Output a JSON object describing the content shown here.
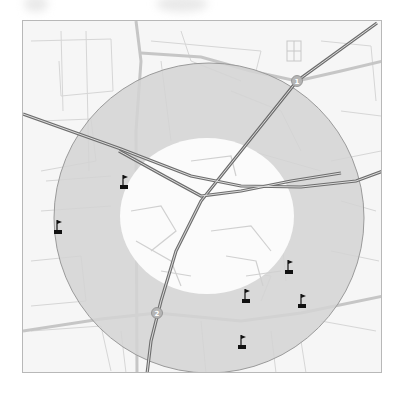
{
  "map": {
    "type": "radius-ring-map",
    "colors": {
      "background": "#f6f6f6",
      "ring_fill": "#d6d6d6",
      "ring_edge": "#9a9a9a",
      "inner_fill": "#ffffff",
      "minor_road": "#d2d2d2",
      "major_road": "#c4c4c4",
      "highway_outer": "#6e6e6e",
      "highway_inner": "#d8d8d8",
      "marker": "#111111",
      "badge": "#b5b5b5"
    },
    "ring": {
      "center": [
        208,
        217
      ],
      "outer_radius": 155,
      "inner_radius_x": 87,
      "inner_radius_y": 78,
      "inner_center": [
        206,
        215
      ]
    },
    "highway_badges": [
      {
        "label": "1",
        "x": 296,
        "y": 80
      },
      {
        "label": "2",
        "x": 156,
        "y": 312
      }
    ],
    "markers": [
      {
        "icon": "flag-icon",
        "x": 57,
        "y": 228
      },
      {
        "icon": "flag-icon",
        "x": 123,
        "y": 183
      },
      {
        "icon": "flag-icon",
        "x": 288,
        "y": 268
      },
      {
        "icon": "flag-icon",
        "x": 245,
        "y": 297
      },
      {
        "icon": "flag-icon",
        "x": 301,
        "y": 302
      },
      {
        "icon": "flag-icon",
        "x": 241,
        "y": 343
      }
    ]
  }
}
